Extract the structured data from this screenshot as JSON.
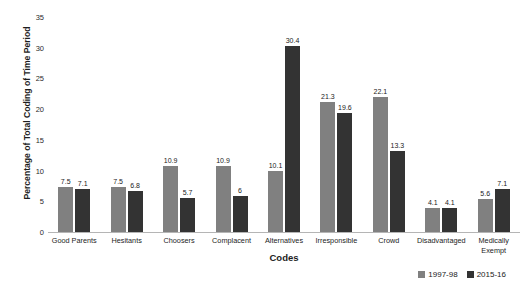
{
  "top_cut_caption": "",
  "chart_data": {
    "type": "bar",
    "title": "",
    "xlabel": "Codes",
    "ylabel": "Percentage of Total Coding of Time Period",
    "ylim": [
      0,
      35
    ],
    "yticks": [
      0,
      5,
      10,
      15,
      20,
      25,
      30,
      35
    ],
    "grid": false,
    "legend_position": "bottom-right",
    "categories": [
      "Good Parents",
      "Hesitants",
      "Choosers",
      "Complacent",
      "Alternatives",
      "Irresponsible",
      "Crowd",
      "Disadvantaged",
      "Medically\nExempt"
    ],
    "series": [
      {
        "name": "1997-98",
        "color": "#808080",
        "values": [
          7.5,
          7.5,
          10.9,
          10.9,
          10.1,
          21.3,
          22.1,
          4.1,
          5.6
        ],
        "labels": [
          "7.5",
          "7.5",
          "10.9",
          "10.9",
          "10.1",
          "21.3",
          "22.1",
          "4.1",
          "5.6"
        ]
      },
      {
        "name": "2015-16",
        "color": "#333333",
        "values": [
          7.1,
          6.8,
          5.7,
          6,
          30.4,
          19.6,
          13.3,
          4.1,
          7.1
        ],
        "labels": [
          "7.1",
          "6.8",
          "5.7",
          "6",
          "30.4",
          "19.6",
          "13.3",
          "4.1",
          "7.1"
        ]
      }
    ]
  }
}
